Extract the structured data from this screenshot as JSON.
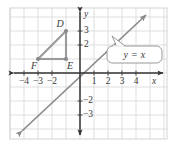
{
  "figure": {
    "colors": {
      "grid": "#d5d5d5",
      "axis": "#333333",
      "line": "#8a8a8a",
      "shape": "#9a9a9a",
      "text": "#3a3a3a",
      "plot_border": "#cfcfcf",
      "background": "#ffffff"
    }
  },
  "axes": {
    "x_label": "x",
    "y_label": "y",
    "x_ticks": [
      {
        "value": -4,
        "label": "−4"
      },
      {
        "value": -3,
        "label": "−3"
      },
      {
        "value": -2,
        "label": "−2"
      },
      {
        "value": 1,
        "label": "1"
      },
      {
        "value": 2,
        "label": "2"
      },
      {
        "value": 3,
        "label": "3"
      },
      {
        "value": 4,
        "label": "4"
      }
    ],
    "y_ticks": [
      {
        "value": 3,
        "label": "3"
      },
      {
        "value": 2,
        "label": "2"
      },
      {
        "value": -2,
        "label": "−2"
      },
      {
        "value": -3,
        "label": "−3"
      }
    ],
    "x_range": [
      -5,
      5
    ],
    "y_range": [
      -4.5,
      4.5
    ],
    "grid": true
  },
  "shape": {
    "name": "triangle-def",
    "vertices": [
      {
        "name": "D",
        "label": "D",
        "x": -1,
        "y": 3
      },
      {
        "name": "E",
        "label": "E",
        "x": -1,
        "y": 1
      },
      {
        "name": "F",
        "label": "F",
        "x": -3,
        "y": 1
      }
    ]
  },
  "line": {
    "equation": "y = x",
    "slope": 1,
    "intercept": 0,
    "arrow_both_ends": true
  },
  "callout": {
    "text": "y = x",
    "points_to": "line-y-equals-x"
  }
}
